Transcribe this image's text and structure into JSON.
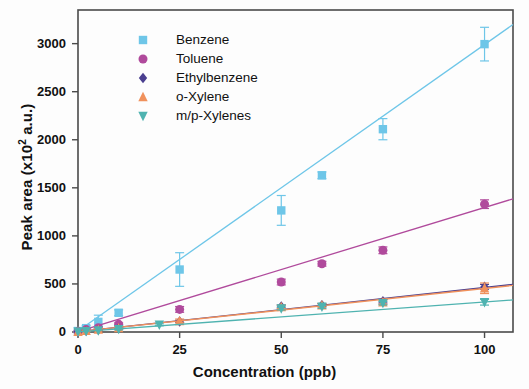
{
  "chart_data": {
    "type": "scatter",
    "title": "",
    "xlabel": "Concentration (ppb)",
    "ylabel": "Peak area (x10² a.u.)",
    "ylabel_base": "Peak area (x10",
    "ylabel_exp": "2",
    "ylabel_tail": " a.u.)",
    "xlim": [
      0,
      107
    ],
    "ylim": [
      0,
      3350
    ],
    "xticks": [
      0,
      25,
      50,
      75,
      100
    ],
    "xtick_labels": [
      "0",
      "25",
      "50",
      "75",
      "100"
    ],
    "yticks": [
      0,
      500,
      1000,
      1500,
      2000,
      2500,
      3000
    ],
    "ytick_labels": [
      "0",
      "500",
      "1000",
      "1500",
      "2000",
      "2500",
      "3000"
    ],
    "grid": false,
    "legend_position": "upper-left-inside",
    "frame": "box",
    "series": [
      {
        "name": "Benzene",
        "color": "#6ec6e8",
        "marker": "square",
        "x": [
          0,
          2,
          5,
          10,
          25,
          50,
          60,
          75,
          100
        ],
        "y": [
          10,
          40,
          105,
          200,
          650,
          1265,
          1630,
          2110,
          2995
        ],
        "yerr": [
          8,
          25,
          70,
          30,
          175,
          155,
          35,
          110,
          175
        ],
        "fit_slope": 29.8,
        "fit_intercept": 10
      },
      {
        "name": "Toluene",
        "color": "#b04a9c",
        "marker": "circle",
        "x": [
          0,
          2,
          5,
          10,
          25,
          50,
          60,
          75,
          100
        ],
        "y": [
          5,
          25,
          45,
          80,
          235,
          520,
          710,
          850,
          1330
        ],
        "yerr": [
          5,
          10,
          12,
          15,
          30,
          30,
          25,
          35,
          45
        ],
        "fit_slope": 12.9,
        "fit_intercept": 5
      },
      {
        "name": "Ethylbenzene",
        "color": "#4a3f8f",
        "marker": "diamond",
        "x": [
          0,
          2,
          5,
          10,
          25,
          50,
          60,
          75,
          100
        ],
        "y": [
          3,
          12,
          22,
          40,
          110,
          265,
          280,
          320,
          470
        ],
        "yerr": [
          3,
          6,
          8,
          8,
          12,
          15,
          15,
          18,
          25
        ],
        "fit_slope": 4.6,
        "fit_intercept": 3
      },
      {
        "name": "o-Xylene",
        "color": "#f0915c",
        "marker": "triangle-up",
        "x": [
          0,
          2,
          5,
          10,
          25,
          50,
          60,
          75,
          100
        ],
        "y": [
          3,
          12,
          25,
          42,
          115,
          260,
          278,
          310,
          455
        ],
        "yerr": [
          3,
          8,
          12,
          10,
          20,
          18,
          18,
          22,
          55
        ],
        "fit_slope": 4.5,
        "fit_intercept": 3
      },
      {
        "name": "m/p-Xylenes",
        "color": "#4fb3b0",
        "marker": "triangle-down",
        "x": [
          0,
          2,
          5,
          10,
          20,
          50,
          60,
          75,
          100
        ],
        "y": [
          2,
          8,
          15,
          30,
          75,
          245,
          262,
          300,
          310
        ],
        "yerr": [
          2,
          5,
          6,
          8,
          10,
          15,
          15,
          18,
          30
        ],
        "fit_slope": 3.1,
        "fit_intercept": 2
      }
    ]
  },
  "legend": {
    "items": [
      {
        "label": "Benzene"
      },
      {
        "label": "Toluene"
      },
      {
        "label": "Ethylbenzene"
      },
      {
        "label": "o-Xylene"
      },
      {
        "label": "m/p-Xylenes"
      }
    ]
  },
  "axes": {
    "x_title": "Concentration (ppb)",
    "y_title_prefix": "Peak area (x10",
    "y_title_exponent": "2",
    "y_title_suffix": " a.u.)"
  }
}
